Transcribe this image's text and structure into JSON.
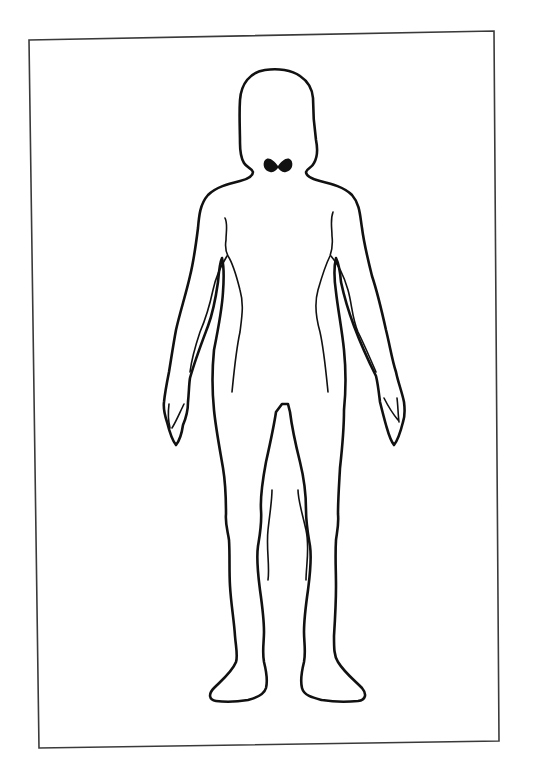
{
  "figure": {
    "type": "body-outline-diagram",
    "subject": "female-front-view",
    "highlighted_organ": "thyroid"
  },
  "colors": {
    "background": "#ffffff",
    "frame": "#3a3a3a",
    "outline": "#111111",
    "highlight": "#111111"
  }
}
